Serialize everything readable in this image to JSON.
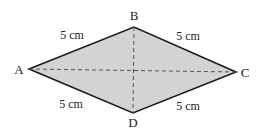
{
  "diagram": {
    "shape": "rhombus",
    "colors": {
      "fill": "#d3d3d3",
      "stroke": "#1a1a1a",
      "diagonal": "#555555"
    },
    "vertices": {
      "A": {
        "label": "A",
        "x": 29,
        "y": 69
      },
      "B": {
        "label": "B",
        "x": 134,
        "y": 27
      },
      "C": {
        "label": "C",
        "x": 236,
        "y": 72
      },
      "D": {
        "label": "D",
        "x": 133,
        "y": 113
      }
    },
    "vertex_labels": {
      "A": {
        "text": "A",
        "x": 19,
        "y": 74
      },
      "B": {
        "text": "B",
        "x": 134,
        "y": 20
      },
      "C": {
        "text": "C",
        "x": 245,
        "y": 77
      },
      "D": {
        "text": "D",
        "x": 133,
        "y": 127
      }
    },
    "sides": {
      "AB": {
        "text": "5 cm",
        "x": 72,
        "y": 39
      },
      "BC": {
        "text": "5 cm",
        "x": 188,
        "y": 40
      },
      "AD": {
        "text": "5 cm",
        "x": 71,
        "y": 108
      },
      "DC": {
        "text": "5 cm",
        "x": 188,
        "y": 110
      }
    },
    "diagonals": [
      "AC",
      "BD"
    ]
  }
}
